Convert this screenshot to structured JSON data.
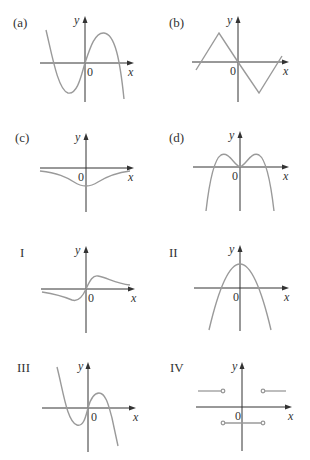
{
  "figure": {
    "axis_labels": {
      "x": "x",
      "y": "y",
      "origin": "0"
    },
    "colors": {
      "curve": "#9a9a9a",
      "axis": "#333333",
      "text": "#333333",
      "background": "#ffffff"
    },
    "panels": [
      {
        "id": "a",
        "label": "(a)",
        "description": "cubic-like curve: descends from upper left, local min left of origin, passes through origin, local max right of origin, descends to lower right"
      },
      {
        "id": "b",
        "label": "(b)",
        "description": "piecewise linear zigzag: rises to peak left of origin, falls through origin to trough right of origin, rises again"
      },
      {
        "id": "c",
        "label": "(c)",
        "description": "inverted bell curve below x-axis with minimum at x=0"
      },
      {
        "id": "d",
        "label": "(d)",
        "description": "quartic-like M shape: two maxima symmetric about y-axis, local min at origin, both ends go down"
      },
      {
        "id": "I",
        "label": "I",
        "description": "odd function: negative dip left of origin, through origin, positive hump right, asymptotic to x-axis"
      },
      {
        "id": "II",
        "label": "II",
        "description": "downward parabola with vertex on positive y-axis"
      },
      {
        "id": "III",
        "label": "III",
        "description": "cubic: descends from upper left, local min left of origin, passes through origin, local max right, descends"
      },
      {
        "id": "IV",
        "label": "IV",
        "description": "step function with open circles: positive constant left, negative constant in middle interval, positive constant right"
      }
    ]
  }
}
